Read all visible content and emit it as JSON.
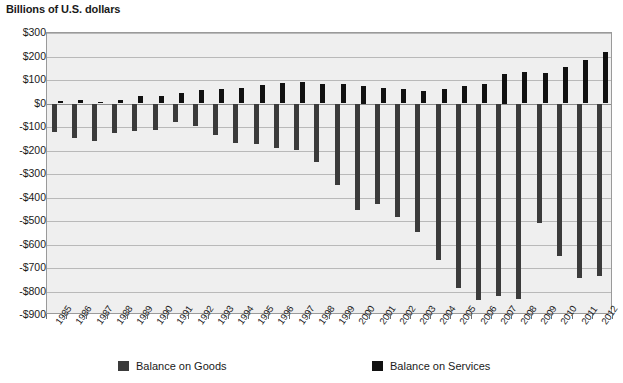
{
  "chart_data": {
    "type": "bar",
    "title": "Billions of U.S. dollars",
    "xlabel": "",
    "ylabel": "Billions of U.S. dollars",
    "ylim": [
      -900,
      300
    ],
    "ytick_step": 100,
    "grid": true,
    "legend_position": "bottom",
    "categories": [
      "1985",
      "1986",
      "1987",
      "1988",
      "1989",
      "1990",
      "1991",
      "1992",
      "1993",
      "1994",
      "1995",
      "1996",
      "1997",
      "1998",
      "1999",
      "2000",
      "2001",
      "2002",
      "2003",
      "2004",
      "2005",
      "2006",
      "2007",
      "2008",
      "2009",
      "2010",
      "2011",
      "2012"
    ],
    "ytick_labels": [
      "$300",
      "$200",
      "$100",
      "$0",
      "-$100",
      "-$200",
      "-$300",
      "-$400",
      "-$500",
      "-$600",
      "-$700",
      "-$800",
      "-$900"
    ],
    "ytick_values": [
      300,
      200,
      100,
      0,
      -100,
      -200,
      -300,
      -400,
      -500,
      -600,
      -700,
      -800,
      -900
    ],
    "series": [
      {
        "name": "Balance on Goods",
        "color": "#3b3b3b",
        "values": [
          -122,
          -145,
          -160,
          -127,
          -116,
          -111,
          -77,
          -97,
          -133,
          -166,
          -174,
          -191,
          -198,
          -248,
          -346,
          -452,
          -427,
          -482,
          -547,
          -665,
          -783,
          -837,
          -821,
          -832,
          -509,
          -648,
          -741,
          -735
        ]
      },
      {
        "name": "Balance on Services",
        "color": "#111111",
        "values": [
          10,
          14,
          8,
          16,
          30,
          30,
          45,
          56,
          60,
          68,
          78,
          87,
          90,
          82,
          83,
          75,
          65,
          62,
          55,
          62,
          76,
          84,
          125,
          136,
          130,
          154,
          187,
          220
        ]
      }
    ]
  },
  "legend": {
    "goods_label": "Balance on Goods",
    "services_label": "Balance on Services"
  },
  "colors": {
    "goods": "#3b3b3b",
    "services": "#111111",
    "plot_background": "#efefef",
    "gridline": "#b9b9b9",
    "frame": "#9a9a9a"
  }
}
